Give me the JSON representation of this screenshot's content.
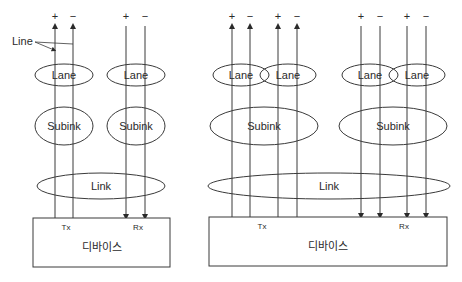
{
  "diagram": {
    "colors": {
      "stroke": "#3a3a3a",
      "text": "#2a2a2a",
      "background": "#ffffff"
    },
    "callout": {
      "label": "Line",
      "x": 12,
      "y": 45,
      "targets": [
        [
          54,
          50
        ],
        [
          73,
          44
        ]
      ]
    },
    "left": {
      "lines": [
        {
          "x": 55,
          "sign": "+",
          "dir": "up"
        },
        {
          "x": 73,
          "sign": "−",
          "dir": "up"
        },
        {
          "x": 126,
          "sign": "+",
          "dir": "down"
        },
        {
          "x": 145,
          "sign": "−",
          "dir": "down"
        }
      ],
      "lanes": [
        {
          "label": "Lane",
          "cx": 64,
          "cy": 75,
          "rx": 29,
          "ry": 11
        },
        {
          "label": "Lane",
          "cx": 136,
          "cy": 75,
          "rx": 29,
          "ry": 11
        }
      ],
      "sublinks": [
        {
          "label": "Subink",
          "cx": 64,
          "cy": 126,
          "rx": 29,
          "ry": 19
        },
        {
          "label": "Subink",
          "cx": 136,
          "cy": 126,
          "rx": 29,
          "ry": 19
        }
      ],
      "link": {
        "label": "Link",
        "cx": 101,
        "cy": 186,
        "rx": 64,
        "ry": 13
      },
      "device": {
        "label": "디바이스",
        "x": 33,
        "y": 218,
        "w": 137,
        "h": 49,
        "tx": "Tx",
        "rx": "Rx",
        "tx_x": 66,
        "rx_x": 138
      }
    },
    "right": {
      "lines": [
        {
          "x": 232,
          "sign": "+",
          "dir": "up"
        },
        {
          "x": 250,
          "sign": "−",
          "dir": "up"
        },
        {
          "x": 278,
          "sign": "+",
          "dir": "up"
        },
        {
          "x": 297,
          "sign": "−",
          "dir": "up"
        },
        {
          "x": 361,
          "sign": "+",
          "dir": "down"
        },
        {
          "x": 380,
          "sign": "−",
          "dir": "down"
        },
        {
          "x": 407,
          "sign": "+",
          "dir": "down"
        },
        {
          "x": 426,
          "sign": "−",
          "dir": "down"
        }
      ],
      "lanes": [
        {
          "label": "Lane",
          "cx": 241,
          "cy": 75,
          "rx": 28,
          "ry": 11
        },
        {
          "label": "Lane",
          "cx": 288,
          "cy": 75,
          "rx": 28,
          "ry": 11
        },
        {
          "label": "Lane",
          "cx": 370,
          "cy": 75,
          "rx": 28,
          "ry": 11
        },
        {
          "label": "Lane",
          "cx": 417,
          "cy": 75,
          "rx": 28,
          "ry": 11
        }
      ],
      "sublinks": [
        {
          "label": "Subink",
          "cx": 264,
          "cy": 126,
          "rx": 54,
          "ry": 19
        },
        {
          "label": "Subink",
          "cx": 393,
          "cy": 126,
          "rx": 54,
          "ry": 19
        }
      ],
      "link": {
        "label": "Link",
        "cx": 329,
        "cy": 186,
        "rx": 121,
        "ry": 13
      },
      "device": {
        "label": "디바이스",
        "x": 209,
        "y": 217,
        "w": 238,
        "h": 49,
        "tx": "Tx",
        "rx": "Rx",
        "tx_x": 262,
        "rx_x": 404
      }
    }
  }
}
